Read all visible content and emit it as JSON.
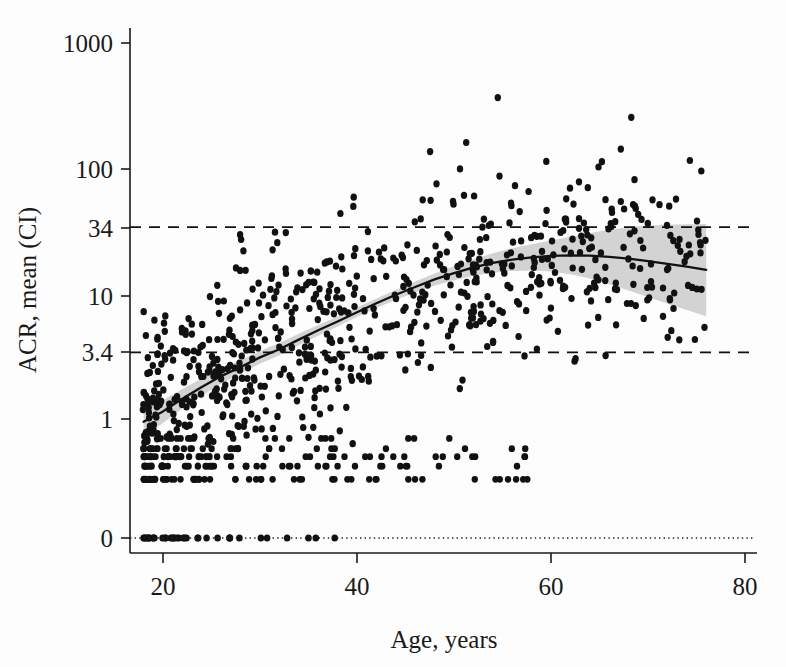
{
  "figure": {
    "title": "",
    "xlabel": "Age, years",
    "ylabel": "ACR, mean (CI)"
  },
  "chart_data": {
    "type": "scatter",
    "title": "",
    "xlabel": "Age, years",
    "ylabel": "ACR, mean (CI)",
    "xlim": [
      17,
      80
    ],
    "ylim_log": [
      0.28,
      1000
    ],
    "yscale": "log (with 0 shown at baseline)",
    "xticks": [
      20,
      40,
      60,
      80
    ],
    "xticklabels": [
      "20",
      "40",
      "60",
      "80"
    ],
    "yticks": [
      1000,
      100,
      34,
      10,
      3.4,
      1,
      0
    ],
    "yticklabels": [
      "1000",
      "100",
      "34",
      "10",
      "3.4",
      "1",
      "0"
    ],
    "grid": false,
    "legend": null,
    "reference_lines": [
      {
        "name": "upper-threshold",
        "y": 34,
        "style": "dashed",
        "label": "34"
      },
      {
        "name": "lower-threshold",
        "y": 3.4,
        "style": "dashed",
        "label": "3.4"
      },
      {
        "name": "zero-baseline",
        "y": 0,
        "style": "dotted",
        "label": "0"
      }
    ],
    "fit_curve": {
      "name": "mean ACR fit",
      "x": [
        18,
        20,
        22,
        24,
        26,
        28,
        30,
        32,
        34,
        36,
        38,
        40,
        42,
        44,
        46,
        48,
        50,
        52,
        54,
        56,
        58,
        60,
        62,
        64,
        66,
        68,
        70,
        72,
        74,
        76
      ],
      "y": [
        0.95,
        1.15,
        1.45,
        1.8,
        2.2,
        2.6,
        3.1,
        3.6,
        4.3,
        5.1,
        6.0,
        7.1,
        8.4,
        9.8,
        11.3,
        13.0,
        14.6,
        16.2,
        17.6,
        18.7,
        19.5,
        20.0,
        20.2,
        20.1,
        19.7,
        19.0,
        18.2,
        17.3,
        16.4,
        15.5
      ]
    },
    "ci_band": {
      "name": "confidence interval",
      "x": [
        18,
        20,
        22,
        24,
        26,
        28,
        30,
        32,
        34,
        36,
        38,
        40,
        42,
        44,
        46,
        48,
        50,
        52,
        54,
        56,
        58,
        60,
        62,
        64,
        66,
        68,
        70,
        72,
        74,
        76
      ],
      "lower": [
        0.72,
        0.93,
        1.21,
        1.54,
        1.92,
        2.3,
        2.76,
        3.22,
        3.87,
        4.62,
        5.46,
        6.5,
        7.7,
        8.95,
        10.2,
        11.6,
        12.8,
        13.9,
        14.7,
        15.2,
        15.3,
        15.0,
        14.3,
        13.2,
        11.9,
        10.6,
        9.4,
        8.3,
        7.4,
        6.6
      ],
      "upper": [
        1.25,
        1.42,
        1.74,
        2.1,
        2.52,
        2.94,
        3.48,
        4.03,
        4.78,
        5.63,
        6.59,
        7.76,
        9.16,
        10.7,
        12.5,
        14.5,
        16.6,
        18.8,
        21.0,
        23.0,
        24.8,
        26.6,
        28.5,
        30.4,
        32.4,
        34.0,
        35.0,
        35.5,
        35.8,
        36.0
      ]
    },
    "marker": {
      "shape": "circle",
      "color": "#111111",
      "size_px": 4.2
    },
    "n_points_approx": 760
  },
  "colors": {
    "ink": "#111111",
    "band": "#c9c9c9",
    "background": "#fdfdfd"
  }
}
